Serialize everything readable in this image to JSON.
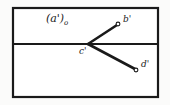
{
  "figure": {
    "background_color": "#fbfbfa",
    "paper_color": "#ffffff",
    "ink_color": "#1a1a1a",
    "frame": {
      "left": 13,
      "top": 8,
      "right": 158,
      "bottom": 97,
      "stroke_width": 2.2
    },
    "ground_line": {
      "name": "horizontal-projection-axis",
      "y": 44,
      "x_start": 13,
      "x_end": 158,
      "stroke_width": 2.2
    },
    "points": [
      {
        "id": "c",
        "label": "c'",
        "x": 88,
        "y": 44,
        "label_x": 79,
        "label_y": 54,
        "marker": "vertex",
        "on_axis": true
      },
      {
        "id": "b",
        "label": "b'",
        "x": 118,
        "y": 24,
        "label_x": 123,
        "label_y": 22,
        "marker": "small-circle",
        "on_axis": false
      },
      {
        "id": "d",
        "label": "d'",
        "x": 136,
        "y": 70,
        "label_x": 141,
        "label_y": 67,
        "marker": "small-circle",
        "on_axis": false
      }
    ],
    "segments": [
      {
        "id": "cb",
        "name": "segment-c-prime-to-b-prime",
        "from": "c",
        "to": "b",
        "x1": 88,
        "y1": 44,
        "x2": 117,
        "y2": 25,
        "stroke_width": 2.6
      },
      {
        "id": "cd",
        "name": "segment-c-prime-to-d-prime",
        "from": "c",
        "to": "d",
        "x1": 88,
        "y1": 44,
        "x2": 135,
        "y2": 69,
        "stroke_width": 2.6
      }
    ],
    "annotations": [
      {
        "id": "a-prime-sub-zero",
        "name": "plane-label-a-prime",
        "text": "(a')",
        "subscript": "o",
        "x": 46,
        "y": 22,
        "font_size": 11
      }
    ],
    "label_font_size": 9,
    "marker_radius": 1.9
  }
}
